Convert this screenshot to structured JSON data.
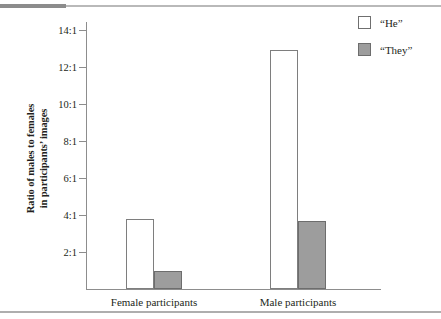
{
  "chart_data": {
    "type": "bar",
    "title": "",
    "xlabel": "",
    "ylabel_line1": "Ratio of males to females",
    "ylabel_line2": "in participants’ images",
    "categories": [
      "Female participants",
      "Male participants"
    ],
    "series": [
      {
        "name": "“He”",
        "values": [
          3.8,
          12.9
        ],
        "color": "#ffffff",
        "border": "#7e7e7e"
      },
      {
        "name": "“They”",
        "values": [
          1.0,
          3.65
        ],
        "color": "#9d9d9d",
        "border": "#6d6d6d"
      }
    ],
    "ylim": [
      0,
      14
    ],
    "ytick_values": [
      2,
      4,
      6,
      8,
      10,
      12,
      14
    ],
    "ytick_labels": [
      "2:1",
      "4:1",
      "6:1",
      "8:1",
      "10:1",
      "12:1",
      "14:1"
    ],
    "grid": false,
    "legend_position": "top-right",
    "legend_entries": [
      "“He”",
      "“They”"
    ],
    "axis_color": "#8d8d8d"
  }
}
